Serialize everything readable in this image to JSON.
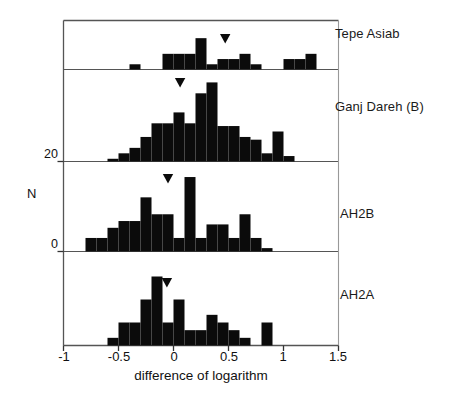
{
  "chart_data": {
    "type": "bar",
    "title": "",
    "subtitle": "",
    "xlabel": "difference of logarithm",
    "ylabel": "N",
    "xlim": [
      -1,
      1.5
    ],
    "ylim": [
      0,
      40
    ],
    "bin_width": 0.1,
    "grid": false,
    "legend_position": "right-panel-labels",
    "xticks": [
      "-1",
      "-0.5",
      "0",
      "0.5",
      "1",
      "1.5"
    ],
    "xtick_values": [
      -1,
      -0.5,
      0,
      0.5,
      1,
      1.5
    ],
    "yticks": [
      "20",
      "0"
    ],
    "ytick_values": [
      20,
      0
    ],
    "annotation_marker": "filled-down-triangle-mean-marker",
    "panels": [
      {
        "name": "Tepe Asiab",
        "mean_marker_x": 0.47,
        "bins": [
          -0.5,
          -0.4,
          -0.3,
          -0.2,
          -0.1,
          0.0,
          0.1,
          0.2,
          0.3,
          0.4,
          0.5,
          0.6,
          0.7,
          0.8,
          0.9,
          1.0,
          1.1,
          1.2,
          1.3
        ],
        "values": [
          0,
          1,
          0,
          0,
          3,
          3,
          3,
          6,
          1,
          2,
          2,
          3,
          1,
          0,
          0,
          2,
          2,
          3,
          0
        ]
      },
      {
        "name": "Ganj Dareh (B)",
        "mean_marker_x": 0.06,
        "bins": [
          -0.6,
          -0.5,
          -0.4,
          -0.3,
          -0.2,
          -0.1,
          0.0,
          0.1,
          0.2,
          0.3,
          0.4,
          0.5,
          0.6,
          0.7,
          0.8,
          0.9,
          1.0
        ],
        "values": [
          1,
          3,
          5,
          9,
          14,
          14,
          18,
          14,
          25,
          29,
          13,
          13,
          9,
          8,
          3,
          11,
          2
        ]
      },
      {
        "name": "AH2B",
        "mean_marker_x": -0.05,
        "bins": [
          -0.8,
          -0.7,
          -0.6,
          -0.5,
          -0.4,
          -0.3,
          -0.2,
          -0.1,
          0.0,
          0.1,
          0.2,
          0.3,
          0.4,
          0.5,
          0.6,
          0.7,
          0.8
        ],
        "values": [
          4,
          4,
          7,
          9,
          9,
          16,
          11,
          11,
          4,
          22,
          4,
          8,
          8,
          4,
          11,
          4,
          1
        ]
      },
      {
        "name": "AH2A",
        "mean_marker_x": -0.06,
        "bins": [
          -0.6,
          -0.5,
          -0.4,
          -0.3,
          -0.2,
          -0.1,
          0.0,
          0.1,
          0.2,
          0.3,
          0.4,
          0.5,
          0.6,
          0.7,
          0.8,
          0.9
        ],
        "values": [
          1,
          3,
          3,
          6,
          9,
          3,
          6,
          2,
          2,
          4,
          3,
          2,
          1,
          0,
          3,
          0
        ]
      }
    ]
  }
}
